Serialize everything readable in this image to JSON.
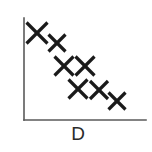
{
  "figure": {
    "background_color": "#ffffff",
    "width": 152,
    "height": 152
  },
  "axes": {
    "color": "#5a5a5a",
    "line_width": 1.6,
    "origin_x": 24,
    "origin_y": 120,
    "y_axis_top": 18,
    "x_axis_right": 146
  },
  "marker": {
    "color": "#1a1a1a",
    "glyph": "x",
    "shape": "cross-x",
    "stroke_width": 3.2
  },
  "axis_label": {
    "x_label": "D",
    "font_size_px": 19,
    "center_x": 78,
    "baseline_y": 143,
    "color": "#2b2b2b"
  },
  "chart_data": {
    "type": "scatter",
    "title": "",
    "xlabel": "D",
    "ylabel": "",
    "grid": false,
    "legend": null,
    "axis_style": "L-shaped spines, no tick marks, no tick labels",
    "trend": "negative",
    "correlation_description": "strong negative correlation",
    "n_points": 7,
    "xlim": [
      0,
      1
    ],
    "ylim": [
      0,
      1
    ],
    "series": [
      {
        "name": "observations",
        "marker": "x",
        "color": "#1a1a1a",
        "points": [
          {
            "px": 37,
            "py": 33,
            "size": 21,
            "x": 0.11,
            "y": 0.85
          },
          {
            "px": 57,
            "py": 43,
            "size": 17,
            "x": 0.27,
            "y": 0.76
          },
          {
            "px": 64,
            "py": 66,
            "size": 19,
            "x": 0.33,
            "y": 0.53
          },
          {
            "px": 85,
            "py": 66,
            "size": 19,
            "x": 0.5,
            "y": 0.53
          },
          {
            "px": 78,
            "py": 89,
            "size": 19,
            "x": 0.44,
            "y": 0.3
          },
          {
            "px": 99,
            "py": 90,
            "size": 18,
            "x": 0.61,
            "y": 0.29
          },
          {
            "px": 117,
            "py": 101,
            "size": 17,
            "x": 0.76,
            "y": 0.19
          }
        ]
      }
    ]
  }
}
